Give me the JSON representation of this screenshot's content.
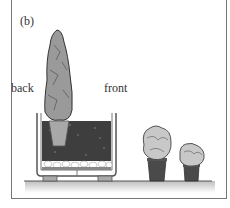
{
  "figure": {
    "panel_label": "(b)",
    "labels": {
      "back": "back",
      "front": "front"
    },
    "elements": [
      "tall conical conifer in pot (back)",
      "soil-filled planter box with drainage layer",
      "large round shrub in pot",
      "small round shrub in pot"
    ]
  }
}
